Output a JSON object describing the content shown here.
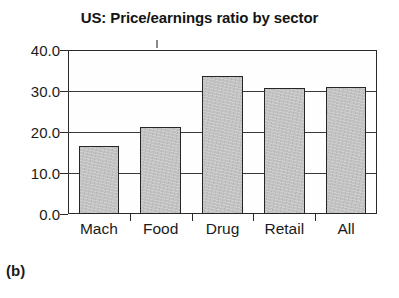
{
  "figure": {
    "caption": "(b)"
  },
  "chart_data": {
    "type": "bar",
    "title": "US: Price/earnings ratio by sector",
    "xlabel": "",
    "ylabel": "",
    "categories": [
      "Mach",
      "Food",
      "Drug",
      "Retail",
      "All"
    ],
    "values": [
      16.6,
      21.3,
      33.7,
      30.8,
      31.0
    ],
    "ylim": [
      0.0,
      40.0
    ],
    "ytick_values": [
      0.0,
      10.0,
      20.0,
      30.0,
      40.0
    ],
    "ytick_labels": [
      "0.0",
      "10.0",
      "20.0",
      "30.0",
      "40.0"
    ],
    "grid": true,
    "grid_axis": "y",
    "legend": false,
    "legend_position": "none",
    "colors": {
      "bar_fill": "#c2c2c2",
      "bar_edge": "#262626",
      "axis": "#2a2a2a",
      "grid": "#3a3a3a",
      "text": "#1b1b1b",
      "background": "#ffffff"
    }
  }
}
